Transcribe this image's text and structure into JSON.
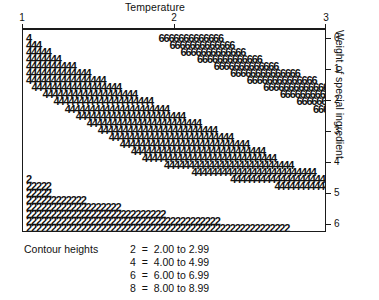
{
  "chart_data": {
    "type": "heatmap",
    "title": "Temperature",
    "xlabel": "Temperature",
    "ylabel": "Weight of special ingredient",
    "x_axis_position": "top",
    "y_axis_position": "right",
    "grid": false,
    "legend_position": "below-plot",
    "xlim": [
      1,
      3
    ],
    "ylim": [
      0,
      6
    ],
    "xticks": [
      {
        "value": 1,
        "label": "1"
      },
      {
        "value": 2,
        "label": "2"
      },
      {
        "value": 3,
        "label": "3"
      }
    ],
    "yticks": [
      {
        "value": 0,
        "label": "0"
      },
      {
        "value": 1,
        "label": "1"
      },
      {
        "value": 2,
        "label": "2"
      },
      {
        "value": 3,
        "label": "3"
      },
      {
        "value": 4,
        "label": "4"
      },
      {
        "value": 5,
        "label": "5"
      },
      {
        "value": 6,
        "label": "6"
      }
    ],
    "legend_title": "Contour heights",
    "legend_entries": [
      {
        "symbol": "2",
        "range": "2.00 to 2.99",
        "text": "2  =  2.00 to 2.99",
        "low": 2.0,
        "high": 2.99
      },
      {
        "symbol": "4",
        "range": "4.00 to 4.99",
        "text": "4  =  4.00 to 4.99",
        "low": 4.0,
        "high": 4.99
      },
      {
        "symbol": "6",
        "range": "6.00 to 6.99",
        "text": "6  =  6.00 to 6.99",
        "low": 6.0,
        "high": 6.99
      },
      {
        "symbol": "8",
        "range": "8.00 to 8.99",
        "text": "8  =  8.00 to 8.99",
        "low": 8.0,
        "high": 8.99
      }
    ],
    "symbols": [
      "2",
      "4",
      "6",
      "8"
    ],
    "rows": [
      {
        "index": 0,
        "y": 0.0,
        "cells": [
          {
            "symbol": "4",
            "col": 0,
            "count": 1
          },
          {
            "symbol": "6",
            "col": 24,
            "count": 13
          },
          {
            "symbol": "8",
            "col": 64,
            "count": 11
          }
        ]
      },
      {
        "index": 1,
        "y": 0.18,
        "cells": [
          {
            "symbol": "4",
            "col": 0,
            "count": 3
          },
          {
            "symbol": "6",
            "col": 26,
            "count": 13
          },
          {
            "symbol": "8",
            "col": 66,
            "count": 11
          }
        ]
      },
      {
        "index": 2,
        "y": 0.36,
        "cells": [
          {
            "symbol": "4",
            "col": 0,
            "count": 5
          },
          {
            "symbol": "6",
            "col": 28,
            "count": 13
          },
          {
            "symbol": "8",
            "col": 69,
            "count": 7
          }
        ]
      },
      {
        "index": 3,
        "y": 0.54,
        "cells": [
          {
            "symbol": "4",
            "col": 0,
            "count": 7
          },
          {
            "symbol": "6",
            "col": 31,
            "count": 13
          },
          {
            "symbol": "8",
            "col": 72,
            "count": 3
          }
        ]
      },
      {
        "index": 4,
        "y": 0.72,
        "cells": [
          {
            "symbol": "4",
            "col": 0,
            "count": 10
          },
          {
            "symbol": "6",
            "col": 34,
            "count": 13
          }
        ]
      },
      {
        "index": 5,
        "y": 0.9,
        "cells": [
          {
            "symbol": "4",
            "col": 0,
            "count": 13
          },
          {
            "symbol": "6",
            "col": 37,
            "count": 14
          }
        ]
      },
      {
        "index": 6,
        "y": 1.08,
        "cells": [
          {
            "symbol": "4",
            "col": 0,
            "count": 16
          },
          {
            "symbol": "6",
            "col": 40,
            "count": 14
          }
        ]
      },
      {
        "index": 7,
        "y": 1.26,
        "cells": [
          {
            "symbol": "4",
            "col": 1,
            "count": 18
          },
          {
            "symbol": "6",
            "col": 43,
            "count": 14
          }
        ]
      },
      {
        "index": 8,
        "y": 1.44,
        "cells": [
          {
            "symbol": "4",
            "col": 3,
            "count": 19
          },
          {
            "symbol": "6",
            "col": 46,
            "count": 14
          }
        ]
      },
      {
        "index": 9,
        "y": 1.62,
        "cells": [
          {
            "symbol": "4",
            "col": 5,
            "count": 20
          },
          {
            "symbol": "6",
            "col": 49,
            "count": 14
          }
        ]
      },
      {
        "index": 10,
        "y": 1.8,
        "cells": [
          {
            "symbol": "4",
            "col": 7,
            "count": 21
          },
          {
            "symbol": "6",
            "col": 52,
            "count": 14
          }
        ]
      },
      {
        "index": 11,
        "y": 1.98,
        "cells": [
          {
            "symbol": "4",
            "col": 9,
            "count": 22
          },
          {
            "symbol": "6",
            "col": 55,
            "count": 15
          }
        ]
      },
      {
        "index": 12,
        "y": 2.16,
        "cells": [
          {
            "symbol": "4",
            "col": 11,
            "count": 23
          },
          {
            "symbol": "6",
            "col": 58,
            "count": 15
          }
        ]
      },
      {
        "index": 13,
        "y": 2.34,
        "cells": [
          {
            "symbol": "4",
            "col": 13,
            "count": 24
          },
          {
            "symbol": "6",
            "col": 62,
            "count": 14
          }
        ]
      },
      {
        "index": 14,
        "y": 2.52,
        "cells": [
          {
            "symbol": "4",
            "col": 15,
            "count": 25
          },
          {
            "symbol": "6",
            "col": 66,
            "count": 10
          }
        ]
      },
      {
        "index": 15,
        "y": 2.7,
        "cells": [
          {
            "symbol": "4",
            "col": 17,
            "count": 26
          },
          {
            "symbol": "6",
            "col": 71,
            "count": 4
          }
        ]
      },
      {
        "index": 16,
        "y": 2.88,
        "cells": [
          {
            "symbol": "4",
            "col": 19,
            "count": 27
          }
        ]
      },
      {
        "index": 17,
        "y": 3.06,
        "cells": [
          {
            "symbol": "4",
            "col": 21,
            "count": 27
          }
        ]
      },
      {
        "index": 18,
        "y": 3.24,
        "cells": [
          {
            "symbol": "4",
            "col": 25,
            "count": 26
          }
        ]
      },
      {
        "index": 19,
        "y": 3.42,
        "cells": [
          {
            "symbol": "4",
            "col": 30,
            "count": 25
          }
        ]
      },
      {
        "index": 20,
        "y": 3.6,
        "cells": [
          {
            "symbol": "2",
            "col": 0,
            "count": 1
          },
          {
            "symbol": "4",
            "col": 37,
            "count": 21
          }
        ]
      },
      {
        "index": 21,
        "y": 3.78,
        "cells": [
          {
            "symbol": "2",
            "col": 0,
            "count": 5
          },
          {
            "symbol": "4",
            "col": 45,
            "count": 16
          }
        ]
      },
      {
        "index": 22,
        "y": 3.96,
        "cells": [
          {
            "symbol": "2",
            "col": 0,
            "count": 5
          },
          {
            "symbol": "4",
            "col": 57,
            "count": 6
          }
        ]
      },
      {
        "index": 23,
        "y": 4.14,
        "cells": [
          {
            "symbol": "2",
            "col": 0,
            "count": 12
          }
        ]
      },
      {
        "index": 24,
        "y": 4.32,
        "cells": [
          {
            "symbol": "2",
            "col": 0,
            "count": 19
          }
        ]
      },
      {
        "index": 25,
        "y": 4.5,
        "cells": [
          {
            "symbol": "2",
            "col": 0,
            "count": 28
          }
        ]
      },
      {
        "index": 26,
        "y": 4.68,
        "cells": [
          {
            "symbol": "2",
            "col": 0,
            "count": 39
          }
        ]
      },
      {
        "index": 27,
        "y": 4.86,
        "cells": [
          {
            "symbol": "2",
            "col": 0,
            "count": 53
          }
        ]
      }
    ]
  },
  "chart": {
    "title": "Temperature",
    "y_axis_title": "Weight of special ingredient",
    "legend_title": "Contour heights"
  }
}
